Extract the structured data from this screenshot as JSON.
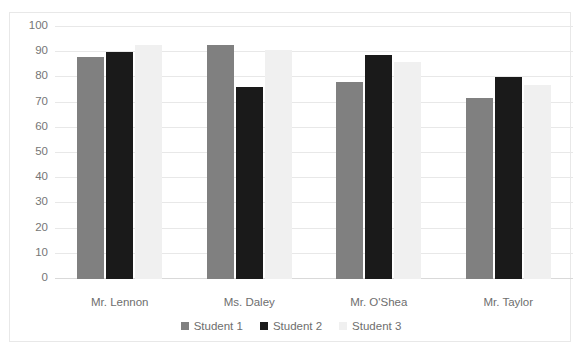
{
  "chart_data": {
    "type": "bar",
    "title": "",
    "xlabel": "",
    "ylabel": "",
    "ylim": [
      0,
      100
    ],
    "ytick_step": 10,
    "yticks": [
      100,
      90,
      80,
      70,
      60,
      50,
      40,
      30,
      20,
      10,
      0
    ],
    "grid": true,
    "legend_position": "bottom",
    "categories": [
      "Mr. Lennon",
      "Ms. Daley",
      "Mr. O'Shea",
      "Mr. Taylor"
    ],
    "series": [
      {
        "name": "Student 1",
        "color": "#808080",
        "values": [
          88,
          93,
          78,
          72
        ]
      },
      {
        "name": "Student 2",
        "color": "#1a1a1a",
        "values": [
          90,
          76,
          89,
          80
        ]
      },
      {
        "name": "Student 3",
        "color": "#f0f0f0",
        "values": [
          93,
          91,
          86,
          77
        ]
      }
    ]
  },
  "colors": {
    "student1": "#808080",
    "student2": "#1a1a1a",
    "student3": "#f0f0f0",
    "gridline": "#e8e8e8",
    "axis_text": "#767676",
    "frame_border": "#e8e8e8"
  },
  "clipped_top_text": ""
}
